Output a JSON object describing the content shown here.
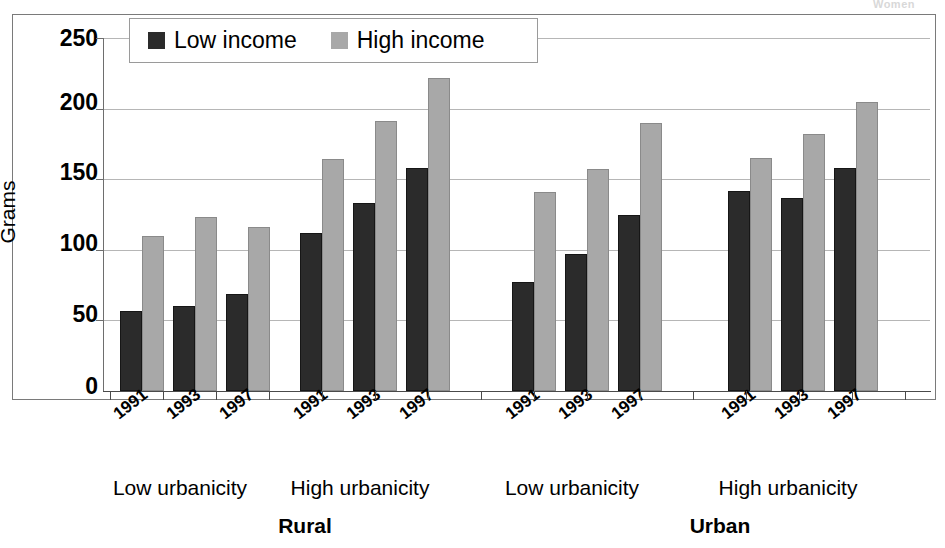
{
  "top_caption": "Women",
  "axis": {
    "ylabel": "Grams",
    "yticks": [
      "250",
      "200",
      "150",
      "100",
      "50",
      "0"
    ],
    "ylim": [
      0,
      250
    ]
  },
  "legend": {
    "items": [
      {
        "label": "Low income",
        "color": "#2b2b2b",
        "icon": "legend-swatch-dark"
      },
      {
        "label": "High income",
        "color": "#a8a8a8",
        "icon": "legend-swatch-light"
      }
    ]
  },
  "xaxis": {
    "years": [
      "1991",
      "1993",
      "1997"
    ],
    "urbanicity": [
      "Low urbanicity",
      "High urbanicity"
    ],
    "groups": [
      "Rural",
      "Urban"
    ]
  },
  "chart_data": {
    "type": "bar",
    "title": "",
    "xlabel": "",
    "ylabel": "Grams",
    "ylim": [
      0,
      250
    ],
    "yticks": [
      0,
      50,
      100,
      150,
      200,
      250
    ],
    "grid": true,
    "legend_position": "top-left-inside",
    "categories": [
      "Rural / Low urbanicity / 1991",
      "Rural / Low urbanicity / 1993",
      "Rural / Low urbanicity / 1997",
      "Rural / High urbanicity / 1991",
      "Rural / High urbanicity / 1993",
      "Rural / High urbanicity / 1997",
      "Urban / Low urbanicity / 1991",
      "Urban / Low urbanicity / 1993",
      "Urban / Low urbanicity / 1997",
      "Urban / High urbanicity / 1991",
      "Urban / High urbanicity / 1993",
      "Urban / High urbanicity / 1997"
    ],
    "series": [
      {
        "name": "Low income",
        "color": "#2b2b2b",
        "values": [
          57,
          60,
          69,
          112,
          133,
          158,
          77,
          97,
          125,
          142,
          137,
          158
        ]
      },
      {
        "name": "High income",
        "color": "#a8a8a8",
        "values": [
          110,
          123,
          116,
          164,
          191,
          222,
          141,
          157,
          190,
          165,
          182,
          205
        ]
      }
    ]
  },
  "layout": {
    "plot_left": 103,
    "plot_top": 38,
    "plot_width": 827,
    "plot_height": 353,
    "cluster_starts": [
      120,
      300,
      512,
      728
    ],
    "cluster_span": 160,
    "slot_width": 53,
    "bar_width": 22
  }
}
